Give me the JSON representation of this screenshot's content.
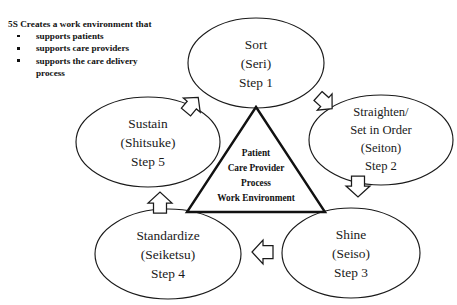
{
  "caption": {
    "title": "5S Creates a work environment that",
    "bullets": [
      {
        "line1": "supports patients",
        "line2": ""
      },
      {
        "line1": "supports care providers",
        "line2": ""
      },
      {
        "line1": "supports the care delivery",
        "line2": "process"
      }
    ]
  },
  "diagram": {
    "core": {
      "label": "central-triangle",
      "lines": [
        "Patient",
        "Care Provider",
        "Process",
        "Work Environment"
      ]
    },
    "nodes": [
      {
        "id": "sort",
        "lines": [
          "Sort",
          "(Seri)",
          "Step 1"
        ]
      },
      {
        "id": "straighten",
        "lines": [
          "Straighten/",
          "Set in Order",
          "(Seiton)",
          "Step 2"
        ]
      },
      {
        "id": "shine",
        "lines": [
          "Shine",
          "(Seiso)",
          "Step 3"
        ]
      },
      {
        "id": "standardize",
        "lines": [
          "Standardize",
          "(Seiketsu)",
          "Step 4"
        ]
      },
      {
        "id": "sustain",
        "lines": [
          "Sustain",
          "(Shitsuke)",
          "Step 5"
        ]
      }
    ],
    "arrows": [
      {
        "id": "sort-to-straighten",
        "direction": "down-right"
      },
      {
        "id": "straighten-to-shine",
        "direction": "down"
      },
      {
        "id": "shine-to-standardize",
        "direction": "left"
      },
      {
        "id": "standardize-to-sustain",
        "direction": "up"
      },
      {
        "id": "sustain-to-sort",
        "direction": "up-right"
      }
    ]
  },
  "colors": {
    "background": "#ffffff",
    "stroke": "#1a1a1a",
    "text": "#1a1a1a",
    "triangle_stroke": "#111111"
  }
}
